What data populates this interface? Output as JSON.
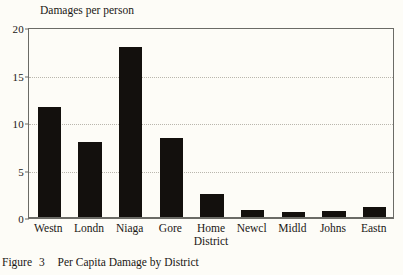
{
  "figure": {
    "caption_prefix": "Figure",
    "caption_number": "3",
    "caption_text": "Per Capita Damage by District"
  },
  "chart_data": {
    "type": "bar",
    "title": "Damages per person",
    "xlabel": "",
    "ylabel": "Damages per person",
    "ylim": [
      0,
      20
    ],
    "yticks": [
      0,
      5,
      10,
      15,
      20
    ],
    "ytick_labels": [
      "0",
      "5",
      "10",
      "15",
      "20"
    ],
    "grid": "horizontal-dotted",
    "legend": "none",
    "bar_color": "#13100d",
    "categories": [
      "Westn",
      "Londn",
      "Niaga",
      "Gore",
      "Home District",
      "Newcl",
      "Midld",
      "Johns",
      "Eastn"
    ],
    "category_lines": [
      [
        "Westn"
      ],
      [
        "Londn"
      ],
      [
        "Niaga"
      ],
      [
        "Gore"
      ],
      [
        "Home",
        "District"
      ],
      [
        "Newcl"
      ],
      [
        "Midld"
      ],
      [
        "Johns"
      ],
      [
        "Eastn"
      ]
    ],
    "values": [
      11.7,
      8.0,
      18.0,
      8.4,
      2.5,
      0.8,
      0.6,
      0.7,
      1.2
    ]
  }
}
